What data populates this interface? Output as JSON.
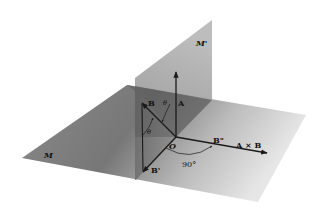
{
  "diagram": {
    "planes": {
      "horizontal": {
        "label": "M"
      },
      "vertical": {
        "label": "M'"
      }
    },
    "origin": {
      "label": "O"
    },
    "vectors": {
      "A": {
        "label": "A"
      },
      "B": {
        "label": "B"
      },
      "B_prime": {
        "label": "B'"
      },
      "B_double_prime": {
        "label": "B\""
      },
      "cross": {
        "label": "A × B"
      }
    },
    "angles": {
      "theta_upper": "θ",
      "theta_lower": "θ",
      "right_angle": "90°"
    },
    "colors": {
      "plane_dark": "#6e6e6e",
      "plane_light": "#c8c8c8",
      "vertical_plane": "#a8a8a8",
      "arrow": "#1a1a1a"
    }
  }
}
